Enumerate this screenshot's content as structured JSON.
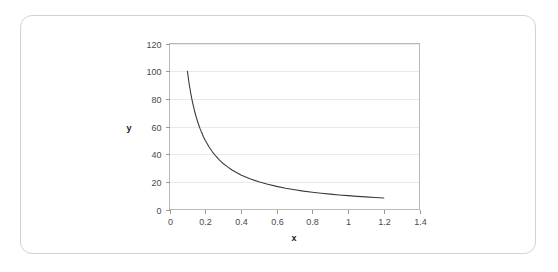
{
  "card": {
    "name": "chart-card",
    "border_color": "#d2d2d2",
    "background": "#ffffff"
  },
  "chart_data": {
    "type": "line",
    "title": "",
    "subtitle": "",
    "xlabel": "x",
    "ylabel": "y",
    "xlim": [
      0,
      1.4
    ],
    "ylim": [
      0,
      120
    ],
    "x_ticks": [
      "0",
      "0.2",
      "0.4",
      "0.6",
      "0.8",
      "1",
      "1.2",
      "1.4"
    ],
    "x_tick_values": [
      0,
      0.2,
      0.4,
      0.6,
      0.8,
      1,
      1.2,
      1.4
    ],
    "y_ticks": [
      "0",
      "20",
      "40",
      "60",
      "80",
      "100",
      "120"
    ],
    "y_tick_values": [
      0,
      20,
      40,
      60,
      80,
      100,
      120
    ],
    "grid": "horizontal",
    "legend": "none",
    "series": [
      {
        "name": "y = 10/x",
        "color": "#3b3b3b",
        "x": [
          0.1,
          0.11,
          0.12,
          0.13,
          0.14,
          0.15,
          0.16,
          0.17,
          0.18,
          0.19,
          0.2,
          0.22,
          0.24,
          0.26,
          0.28,
          0.3,
          0.325,
          0.35,
          0.375,
          0.4,
          0.45,
          0.5,
          0.55,
          0.6,
          0.65,
          0.7,
          0.75,
          0.8,
          0.85,
          0.9,
          0.95,
          1.0,
          1.05,
          1.1,
          1.15,
          1.2
        ],
        "y": [
          100.0,
          90.9,
          83.3,
          76.9,
          71.4,
          66.7,
          62.5,
          58.8,
          55.6,
          52.6,
          50.0,
          45.5,
          41.7,
          38.5,
          35.7,
          33.3,
          30.8,
          28.6,
          26.7,
          25.0,
          22.2,
          20.0,
          18.2,
          16.7,
          15.4,
          14.3,
          13.3,
          12.5,
          11.8,
          11.1,
          10.5,
          10.0,
          9.5,
          9.1,
          8.7,
          8.3
        ]
      }
    ]
  }
}
